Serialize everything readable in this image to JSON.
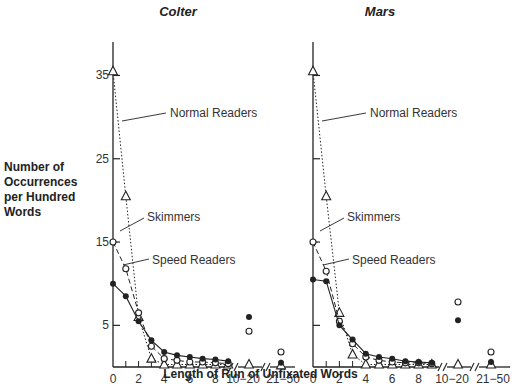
{
  "figure": {
    "ylabel_lines": [
      "Number of",
      "Occurrences",
      "per Hundred",
      "Words"
    ],
    "xlabel": "Length of Run of Unfixated Words"
  },
  "chart_data": [
    {
      "type": "line",
      "title": "Colter",
      "xlabel": "Length of Run of Unfixated Words",
      "ylabel": "Number of Occurrences per Hundred Words",
      "x_tick_labels": [
        "0",
        "2",
        "4",
        "6",
        "8",
        "10-20",
        "21-50"
      ],
      "y_tick_labels": [
        "5",
        "15",
        "25",
        "35"
      ],
      "ylim": [
        0,
        37
      ],
      "categories": [
        "0",
        "1",
        "2",
        "3",
        "4",
        "5",
        "6",
        "7",
        "8",
        "9",
        "10-20",
        "21-50"
      ],
      "series": [
        {
          "name": "Normal Readers",
          "marker": "open-triangle",
          "line": "dotted",
          "values": [
            35.5,
            20.5,
            6.0,
            1.0,
            0.3,
            0.3,
            0.3,
            0.3,
            0.3,
            0.3,
            0.3,
            0.2
          ]
        },
        {
          "name": "Skimmers",
          "marker": "open-circle",
          "line": "dashed",
          "values": [
            15.0,
            11.8,
            6.5,
            2.5,
            1.0,
            0.8,
            0.6,
            0.6,
            0.5,
            0.4,
            4.3,
            1.8
          ]
        },
        {
          "name": "Speed Readers",
          "marker": "filled-circle",
          "line": "solid",
          "values": [
            10.0,
            8.5,
            5.5,
            3.2,
            1.8,
            1.4,
            1.2,
            1.0,
            0.9,
            0.7,
            6.0,
            0.5
          ]
        }
      ],
      "annotations": [
        "Normal Readers",
        "Skimmers",
        "Speed Readers"
      ],
      "grid": false,
      "legend": "inline labels"
    },
    {
      "type": "line",
      "title": "Mars",
      "xlabel": "Length of Run of Unfixated Words",
      "ylabel": "Number of Occurrences per Hundred Words",
      "x_tick_labels": [
        "0",
        "2",
        "4",
        "6",
        "8",
        "10-20",
        "21-50"
      ],
      "y_tick_labels": [
        "5",
        "15",
        "25",
        "35"
      ],
      "ylim": [
        0,
        37
      ],
      "categories": [
        "0",
        "1",
        "2",
        "3",
        "4",
        "5",
        "6",
        "7",
        "8",
        "9",
        "10-20",
        "21-50"
      ],
      "series": [
        {
          "name": "Normal Readers",
          "marker": "open-triangle",
          "line": "dotted",
          "values": [
            35.5,
            20.5,
            6.5,
            1.5,
            0.3,
            0.3,
            0.3,
            0.3,
            0.3,
            0.3,
            0.3,
            0.3
          ]
        },
        {
          "name": "Skimmers",
          "marker": "open-circle",
          "line": "dashed",
          "values": [
            15.0,
            11.5,
            5.5,
            2.8,
            1.2,
            0.8,
            0.6,
            0.5,
            0.5,
            0.4,
            7.8,
            1.8
          ]
        },
        {
          "name": "Speed Readers",
          "marker": "filled-circle",
          "line": "solid",
          "values": [
            10.5,
            10.3,
            5.0,
            3.3,
            1.6,
            1.2,
            1.0,
            0.7,
            0.6,
            0.5,
            5.6,
            0.6
          ]
        }
      ],
      "annotations": [
        "Normal Readers",
        "Skimmers",
        "Speed Readers"
      ],
      "grid": false,
      "legend": "inline labels"
    }
  ]
}
